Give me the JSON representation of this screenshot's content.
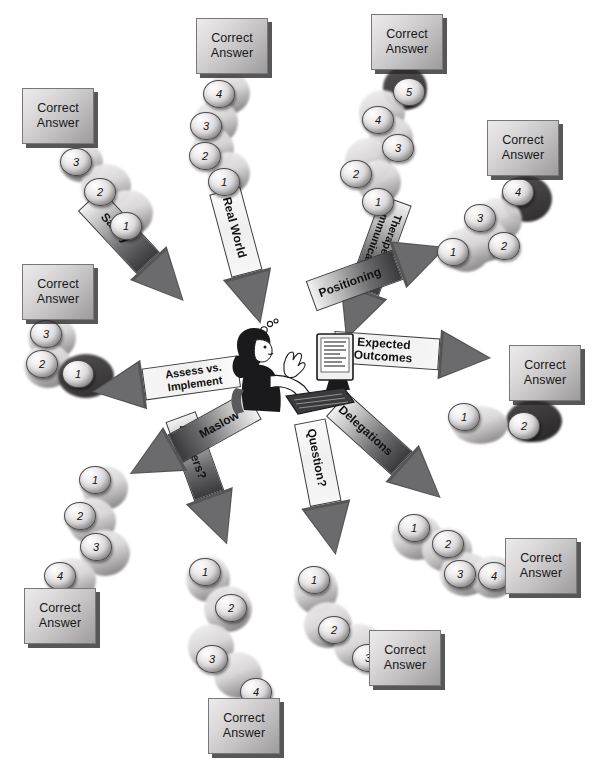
{
  "diagram": {
    "answer_label_line1": "Correct",
    "answer_label_line2": "Answer",
    "center_figure": "nurse-at-computer-illustration",
    "colors": {
      "box_light": "#eceaea",
      "box_dark": "#9d9b9b",
      "box_border": "#77787a",
      "shadow": "#2a2a2c",
      "bead_light": "#ffffff",
      "bead_dark": "#8d8b8b",
      "arrow_outline": "#3c3c3e",
      "background": "#ffffff"
    }
  },
  "branches": [
    {
      "id": "real-world",
      "label": "Real World",
      "direction": "up",
      "beads": [
        "1",
        "2",
        "3",
        "4"
      ],
      "bead_count": 4
    },
    {
      "id": "safety",
      "label": "Safety",
      "direction": "up-left",
      "beads": [
        "1",
        "2",
        "3"
      ],
      "bead_count": 3
    },
    {
      "id": "assess-vs-implement",
      "label": "Assess vs.\nImplement",
      "direction": "left",
      "beads": [
        "1",
        "2",
        "3"
      ],
      "bead_count": 3
    },
    {
      "id": "maslow",
      "label": "Maslow",
      "direction": "down-left",
      "beads": [
        "1",
        "2",
        "3",
        "4"
      ],
      "bead_count": 4
    },
    {
      "id": "answers",
      "label": "Answers?",
      "direction": "down",
      "beads": [
        "1",
        "2",
        "3",
        "4"
      ],
      "bead_count": 4
    },
    {
      "id": "question",
      "label": "Question?",
      "direction": "down",
      "beads": [
        "1",
        "2",
        "3"
      ],
      "bead_count": 3
    },
    {
      "id": "delegations",
      "label": "Delegations",
      "direction": "down-right",
      "beads": [
        "1",
        "2",
        "3",
        "4"
      ],
      "bead_count": 4
    },
    {
      "id": "expected-outcomes",
      "label": "Expected\nOutcomes",
      "direction": "right",
      "beads": [
        "1",
        "2"
      ],
      "bead_count": 2
    },
    {
      "id": "positioning",
      "label": "Positioning",
      "direction": "up-right",
      "beads": [
        "1",
        "2",
        "3",
        "4"
      ],
      "bead_count": 4
    },
    {
      "id": "therapeutic-communication",
      "label": "Therapeutic\nCommunication",
      "direction": "up",
      "beads": [
        "1",
        "2",
        "3",
        "4",
        "5"
      ],
      "bead_count": 5
    }
  ]
}
